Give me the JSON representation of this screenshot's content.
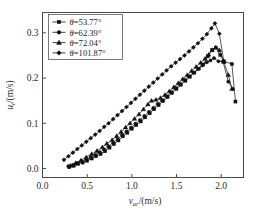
{
  "chart_data": {
    "type": "line",
    "title": "",
    "xlabel": "v_ar/(m/s)",
    "ylabel": "u_t/(m/s)",
    "xlabel_main": "v",
    "xlabel_sub": "ar",
    "xlabel_unit": "/(m/s)",
    "ylabel_main": "u",
    "ylabel_sub": "t",
    "ylabel_unit": "/(m/s)",
    "xlim": [
      0.0,
      2.25
    ],
    "ylim": [
      -0.02,
      0.345
    ],
    "xticks": [
      0.0,
      0.5,
      1.0,
      1.5,
      2.0
    ],
    "xtick_labels": [
      "0.0",
      "0.5",
      "1.0",
      "1.5",
      "2.0"
    ],
    "yticks": [
      0.0,
      0.1,
      0.2,
      0.3
    ],
    "ytick_labels": [
      "0.0",
      "0.1",
      "0.2",
      "0.3"
    ],
    "grid": false,
    "legend_position": "upper-left",
    "marker_color": "#111111",
    "line_color": "#111111",
    "frame_color": "#4a4a4a",
    "series": [
      {
        "name": "theta=53.77",
        "label": "θ=53.77°",
        "marker": "square",
        "x": [
          0.3,
          0.35,
          0.4,
          0.45,
          0.5,
          0.55,
          0.6,
          0.65,
          0.7,
          0.75,
          0.8,
          0.85,
          0.9,
          0.95,
          1.0,
          1.05,
          1.1,
          1.15,
          1.2,
          1.25,
          1.3,
          1.35,
          1.4,
          1.45,
          1.5,
          1.55,
          1.6,
          1.65,
          1.7,
          1.75,
          1.8,
          1.85,
          1.9,
          1.94,
          1.99,
          2.03,
          2.12,
          2.16
        ],
        "y": [
          0.003,
          0.006,
          0.01,
          0.013,
          0.017,
          0.022,
          0.027,
          0.032,
          0.038,
          0.046,
          0.054,
          0.062,
          0.071,
          0.079,
          0.088,
          0.096,
          0.104,
          0.113,
          0.122,
          0.131,
          0.14,
          0.149,
          0.158,
          0.167,
          0.176,
          0.185,
          0.194,
          0.203,
          0.212,
          0.221,
          0.23,
          0.248,
          0.262,
          0.267,
          0.251,
          0.237,
          0.231,
          0.148
        ]
      },
      {
        "name": "theta=62.39",
        "label": "θ=62.39°",
        "marker": "circle",
        "x": [
          0.29,
          0.34,
          0.39,
          0.44,
          0.49,
          0.54,
          0.59,
          0.64,
          0.69,
          0.74,
          0.79,
          0.84,
          0.89,
          0.94,
          0.99,
          1.04,
          1.09,
          1.14,
          1.19,
          1.24,
          1.29,
          1.34,
          1.39,
          1.44,
          1.49,
          1.54,
          1.59,
          1.64,
          1.69,
          1.74,
          1.79,
          1.84,
          1.88,
          1.92,
          1.97,
          2.02,
          2.08,
          2.13
        ],
        "y": [
          0.005,
          0.008,
          0.012,
          0.016,
          0.02,
          0.025,
          0.03,
          0.036,
          0.042,
          0.049,
          0.057,
          0.065,
          0.074,
          0.082,
          0.09,
          0.099,
          0.107,
          0.116,
          0.125,
          0.134,
          0.143,
          0.151,
          0.16,
          0.169,
          0.178,
          0.187,
          0.196,
          0.204,
          0.212,
          0.22,
          0.228,
          0.235,
          0.239,
          0.244,
          0.237,
          0.237,
          0.192,
          0.176
        ]
      },
      {
        "name": "theta=72.04",
        "label": "θ=72.04°",
        "marker": "triangle",
        "x": [
          0.31,
          0.37,
          0.43,
          0.49,
          0.55,
          0.61,
          0.67,
          0.72,
          0.78,
          0.83,
          0.88,
          0.93,
          0.98,
          1.03,
          1.08,
          1.13,
          1.18,
          1.22,
          1.27,
          1.32,
          1.37,
          1.42,
          1.47,
          1.52,
          1.57,
          1.62,
          1.67,
          1.72,
          1.77,
          1.82,
          1.86,
          1.9,
          1.94,
          1.98,
          2.03,
          2.08,
          2.12
        ],
        "y": [
          0.006,
          0.012,
          0.018,
          0.025,
          0.032,
          0.039,
          0.047,
          0.055,
          0.063,
          0.072,
          0.081,
          0.091,
          0.1,
          0.11,
          0.12,
          0.131,
          0.142,
          0.15,
          0.152,
          0.156,
          0.163,
          0.171,
          0.18,
          0.189,
          0.198,
          0.207,
          0.216,
          0.225,
          0.234,
          0.243,
          0.252,
          0.262,
          0.268,
          0.262,
          0.236,
          0.207,
          0.176
        ]
      },
      {
        "name": "theta=101.87",
        "label": "θ=101.87°",
        "marker": "diamond",
        "x": [
          0.24,
          0.29,
          0.34,
          0.39,
          0.44,
          0.49,
          0.54,
          0.59,
          0.64,
          0.69,
          0.74,
          0.79,
          0.84,
          0.89,
          0.94,
          0.99,
          1.04,
          1.09,
          1.14,
          1.19,
          1.24,
          1.29,
          1.34,
          1.39,
          1.44,
          1.49,
          1.54,
          1.59,
          1.64,
          1.69,
          1.74,
          1.79,
          1.84,
          1.89,
          1.93,
          1.98,
          2.03
        ],
        "y": [
          0.019,
          0.027,
          0.035,
          0.043,
          0.051,
          0.059,
          0.067,
          0.075,
          0.083,
          0.092,
          0.1,
          0.109,
          0.118,
          0.127,
          0.136,
          0.145,
          0.154,
          0.163,
          0.172,
          0.181,
          0.19,
          0.199,
          0.208,
          0.217,
          0.226,
          0.234,
          0.242,
          0.25,
          0.259,
          0.268,
          0.277,
          0.287,
          0.297,
          0.31,
          0.321,
          0.298,
          0.236
        ]
      }
    ]
  },
  "legend": {
    "items": [
      {
        "label": "θ=53.77°",
        "marker": "square"
      },
      {
        "label": "θ=62.39°",
        "marker": "circle"
      },
      {
        "label": "θ=72.04°",
        "marker": "triangle"
      },
      {
        "label": "θ=101.87°",
        "marker": "diamond"
      }
    ]
  }
}
